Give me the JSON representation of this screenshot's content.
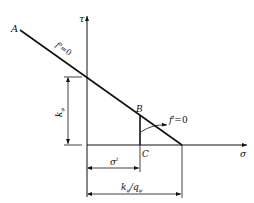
{
  "diagram": {
    "title": "",
    "axes": {
      "vertical_label": "τ",
      "horizontal_label": "σ"
    },
    "points": {
      "a": "A",
      "b": "B",
      "c": "C"
    },
    "curves": {
      "shear_failure": {
        "name": "f",
        "sup": "s",
        "eq": "=0"
      },
      "tension_failure": {
        "name": "f",
        "sup": "t",
        "eq": "=0"
      }
    },
    "dimensions": {
      "intercept": {
        "main": "k",
        "sub": "φ"
      },
      "tensile_strength": {
        "main": "σ",
        "sup": "t"
      },
      "x_intercept": {
        "main1": "k",
        "sub1": "φ",
        "slash": "/",
        "main2": "q",
        "sub2": "φ"
      }
    },
    "colors": {
      "line": "#111111",
      "background": "#ffffff"
    }
  }
}
